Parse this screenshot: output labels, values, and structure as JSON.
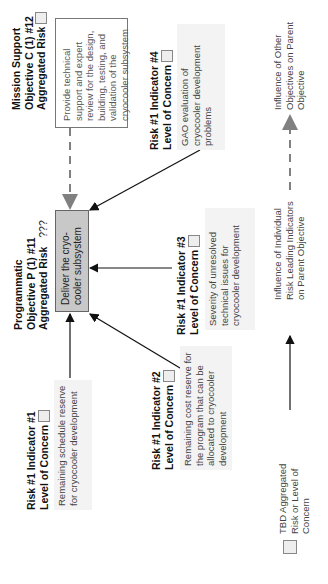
{
  "colors": {
    "center_fill": "#c8c8c8",
    "desc_fill": "#f3f3f3",
    "arrow_solid": "#111111",
    "arrow_dashed": "#808080"
  },
  "parent_objective": {
    "title_line1": "Programmatic",
    "title_line2": "Objective P (1) #11",
    "title_line3": "Aggregated Risk",
    "risk_value": "???",
    "description": "Deliver the cryo-cooler subsystem"
  },
  "mission_objective": {
    "title_line1": "Mission Support",
    "title_line2": "Objective C (1) #12",
    "title_line3": "Aggregated Risk",
    "description": "Provide technical support and expert review for the design, building, testing, and validation of the cryocooler subsystem"
  },
  "indicators": [
    {
      "title_line1": "Risk #1 Indicator #1",
      "title_line2": "Level of Concern",
      "description": "Remaining schedule reserve for cryocooler development"
    },
    {
      "title_line1": "Risk #1 Indicator #2",
      "title_line2": "Level of Concern",
      "description": "Remaining cost reserve for the program that can be allocated to cryocooler development"
    },
    {
      "title_line1": "Risk #1 Indicator #3",
      "title_line2": "Level of Concern",
      "description": "Severity of unresolved technical issues for cryocooler development"
    },
    {
      "title_line1": "Risk #1 Indicator #4",
      "title_line2": "Level of Concern",
      "description": "GAO evaluation of cryocooler development problems"
    }
  ],
  "legend": {
    "tbd": "TBD Aggregated Risk or Level of Concern",
    "solid_arrow": "Influence of Individual Risk Leading Indicators on Parent Objective",
    "dashed_arrow": "Influence of Other Objectives on Parent Objective"
  }
}
